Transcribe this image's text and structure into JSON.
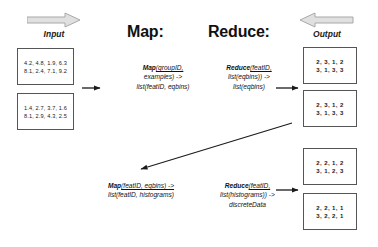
{
  "headers": {
    "input_label": "Input",
    "output_label": "Output",
    "map_heading": "Map:",
    "reduce_heading": "Reduce:"
  },
  "icons": {
    "input_arrow": "right-block-arrow-icon",
    "output_arrow": "left-block-arrow-icon"
  },
  "input_boxes": [
    {
      "line1": "4.2, 4.8, 1.9, 6.3",
      "line2": "8.1, 2.4, 7.1, 9.2"
    },
    {
      "line1": "1.4, 2.7, 3.7, 1.6",
      "line2": "8.1, 2.9, 4.3, 2.5"
    }
  ],
  "output_boxes": [
    {
      "line1": "2, 3, 1, 2",
      "line2": "3, 1, 3, 3"
    },
    {
      "line1": "2, 3, 1, 2",
      "line2": "3, 1, 3, 3"
    },
    {
      "line1": "2, 2, 1, 2",
      "line2": "3, 1, 2, 3"
    },
    {
      "line1": "2, 2, 1, 1",
      "line2": "3, 2, 2, 1"
    }
  ],
  "formulas": {
    "map_top": {
      "fn": "Map",
      "line1_args": "(groupID,",
      "line2": "examples) ->",
      "line3": "list(featID, eqbins)"
    },
    "reduce_top": {
      "fn": "Reduce",
      "line1_args": "(featID,",
      "line2": "list(eqbins)) ->",
      "line3": "list(eqbins)"
    },
    "map_bottom": {
      "fn": "Map",
      "line1_args": "(featID, eqbins) ->",
      "line2": "list(featID, histograms)"
    },
    "reduce_bottom": {
      "fn": "Reduce",
      "line1_args": "(featID,",
      "line2": "list(histograms)) ->",
      "line3": "discreteData"
    }
  },
  "colors": {
    "box_border": "#555555",
    "arrow_grey": "#b3b3b3",
    "arrow_black": "#1a1a1a",
    "text": "#111111"
  }
}
